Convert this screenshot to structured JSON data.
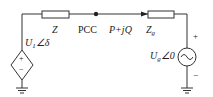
{
  "diagram": {
    "type": "circuit",
    "labels": {
      "source_left": "U",
      "source_left_sub": "1",
      "source_left_angle": "∠δ",
      "impedance_line": "Z",
      "pcc": "PCC",
      "power": "P+jQ",
      "impedance_grid": "Z",
      "impedance_grid_sub": "g",
      "source_grid": "U",
      "source_grid_sub": "g",
      "source_grid_angle": "∠0",
      "plus": "+",
      "minus": "−"
    },
    "colors": {
      "line": "#333333",
      "background": "#ffffff"
    }
  }
}
